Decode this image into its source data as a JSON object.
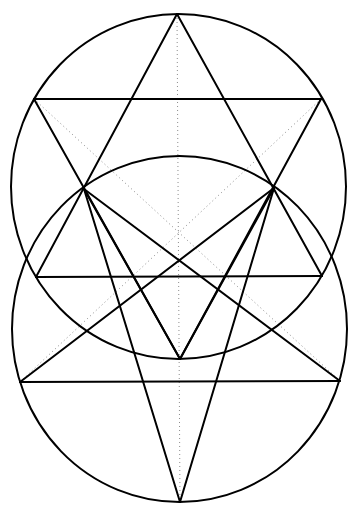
{
  "diagram": {
    "title": "",
    "width": 359,
    "height": 514,
    "colors": {
      "stroke": "#000000",
      "dotted": "#8a8a8a",
      "background": "#ffffff"
    },
    "points": {
      "A_top_apex": [
        177,
        14
      ],
      "B_upper_left": [
        34,
        99
      ],
      "C_upper_right": [
        321,
        99
      ],
      "D_left_cross": [
        84,
        189
      ],
      "E_right_cross": [
        274,
        188
      ],
      "F_mid_left": [
        36,
        277
      ],
      "G_mid_right": [
        322,
        276
      ],
      "H_inner_bottom": [
        180,
        359
      ],
      "I_low_left": [
        20,
        382
      ],
      "J_low_right": [
        340,
        381
      ],
      "K_bottom_apex": [
        180,
        502
      ]
    },
    "circles": [
      {
        "name": "upper-circle",
        "cx": 178.5,
        "cy": 186.5,
        "rx": 167.5,
        "ry": 172.5
      },
      {
        "name": "lower-circle",
        "cx": 179.5,
        "cy": 329,
        "rx": 167.5,
        "ry": 173
      }
    ],
    "solid_lines": [
      {
        "name": "upper-horizontal",
        "from": [
          34,
          99
        ],
        "to": [
          321,
          99
        ]
      },
      {
        "name": "middle-horizontal",
        "from": [
          36,
          277
        ],
        "to": [
          322,
          276
        ]
      },
      {
        "name": "lower-horizontal",
        "from": [
          20,
          382
        ],
        "to": [
          340,
          381
        ]
      },
      {
        "name": "up-triangle-left-side",
        "from": [
          177,
          14
        ],
        "to": [
          36,
          277
        ]
      },
      {
        "name": "up-triangle-right-side",
        "from": [
          177,
          14
        ],
        "to": [
          322,
          276
        ]
      },
      {
        "name": "down-triangle-left-side",
        "from": [
          34,
          99
        ],
        "to": [
          180,
          359
        ]
      },
      {
        "name": "down-triangle-right-side",
        "from": [
          321,
          99
        ],
        "to": [
          180,
          359
        ]
      },
      {
        "name": "left-cross-to-inner-bottom",
        "from": [
          84,
          189
        ],
        "to": [
          180,
          359
        ]
      },
      {
        "name": "right-cross-to-inner-bottom",
        "from": [
          274,
          188
        ],
        "to": [
          180,
          359
        ]
      },
      {
        "name": "left-cross-to-bottom-apex",
        "from": [
          84,
          189
        ],
        "to": [
          180,
          502
        ]
      },
      {
        "name": "right-cross-to-bottom-apex",
        "from": [
          274,
          188
        ],
        "to": [
          180,
          502
        ]
      },
      {
        "name": "left-cross-to-low-right",
        "from": [
          84,
          189
        ],
        "to": [
          340,
          381
        ]
      },
      {
        "name": "right-cross-to-low-left",
        "from": [
          274,
          188
        ],
        "to": [
          20,
          382
        ]
      }
    ],
    "dotted_lines": [
      {
        "name": "center-vertical-axis",
        "from": [
          177,
          14
        ],
        "to": [
          180,
          502
        ]
      },
      {
        "name": "diagonal-upper-left-to-low-right",
        "from": [
          34,
          99
        ],
        "to": [
          340,
          381
        ]
      },
      {
        "name": "diagonal-upper-right-to-low-left",
        "from": [
          321,
          99
        ],
        "to": [
          20,
          382
        ]
      }
    ]
  }
}
